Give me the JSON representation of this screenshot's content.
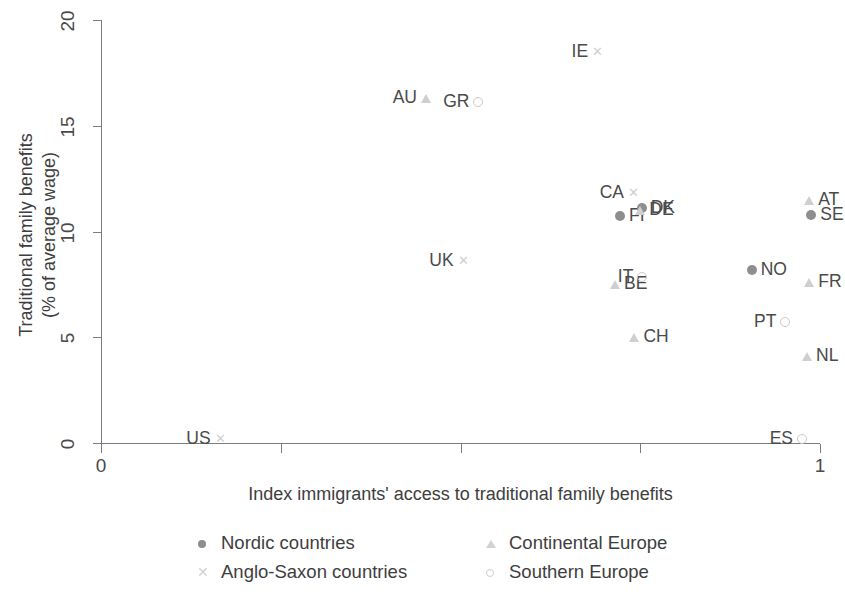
{
  "chart_data": {
    "type": "scatter",
    "title": "",
    "xlabel": "Index immigrants' access to traditional family benefits",
    "ylabel": "Traditional family benefits\n(% of average wage)",
    "ylabel_line1": "Traditional family benefits",
    "ylabel_line2": "(% of average wage)",
    "xlim": [
      0,
      1
    ],
    "ylim": [
      0,
      20
    ],
    "xticks": [
      0,
      1
    ],
    "xtick_labels": [
      "0",
      "1"
    ],
    "xminor_ticks": [
      0.25,
      0.5,
      0.75
    ],
    "yticks": [
      0,
      5,
      10,
      15,
      20
    ],
    "ytick_labels": [
      "0",
      "5",
      "10",
      "15",
      "20"
    ],
    "grid": false,
    "legend_position": "below-axes",
    "series": [
      {
        "name": "Nordic countries",
        "marker": "filled-circle",
        "color": "#8e8e8e",
        "points": [
          {
            "label": "FI",
            "x": 0.722,
            "y": 10.75,
            "label_side": "right"
          },
          {
            "label": "DK",
            "x": 0.752,
            "y": 11.1,
            "label_side": "right"
          },
          {
            "label": "NO",
            "x": 0.905,
            "y": 8.2,
            "label_side": "right"
          },
          {
            "label": "SE",
            "x": 0.988,
            "y": 10.8,
            "label_side": "right"
          }
        ]
      },
      {
        "name": "Anglo-Saxon countries",
        "marker": "cross",
        "color": "#cfcfcf",
        "points": [
          {
            "label": "IE",
            "x": 0.69,
            "y": 18.5,
            "label_side": "left"
          },
          {
            "label": "CA",
            "x": 0.74,
            "y": 11.8,
            "label_side": "left"
          },
          {
            "label": "UK",
            "x": 0.503,
            "y": 8.6,
            "label_side": "left"
          },
          {
            "label": "US",
            "x": 0.165,
            "y": 0.2,
            "label_side": "left"
          }
        ]
      },
      {
        "name": "Continental Europe",
        "marker": "triangle",
        "color": "#cfcfcf",
        "points": [
          {
            "label": "AU",
            "x": 0.452,
            "y": 16.3,
            "label_side": "left"
          },
          {
            "label": "DE",
            "x": 0.75,
            "y": 11.0,
            "label_side": "right"
          },
          {
            "label": "BE",
            "x": 0.715,
            "y": 7.5,
            "label_side": "right"
          },
          {
            "label": "CH",
            "x": 0.742,
            "y": 5.0,
            "label_side": "right"
          },
          {
            "label": "AT",
            "x": 0.985,
            "y": 11.5,
            "label_side": "right"
          },
          {
            "label": "FR",
            "x": 0.985,
            "y": 7.6,
            "label_side": "right"
          },
          {
            "label": "NL",
            "x": 0.982,
            "y": 4.1,
            "label_side": "right"
          }
        ]
      },
      {
        "name": "Southern Europe",
        "marker": "open-circle",
        "color": "#cfcfcf",
        "points": [
          {
            "label": "GR",
            "x": 0.525,
            "y": 16.1,
            "label_side": "left"
          },
          {
            "label": "IT",
            "x": 0.753,
            "y": 7.85,
            "label_side": "left"
          },
          {
            "label": "PT",
            "x": 0.952,
            "y": 5.7,
            "label_side": "left"
          },
          {
            "label": "ES",
            "x": 0.975,
            "y": 0.2,
            "label_side": "left"
          }
        ]
      }
    ]
  },
  "axes": {
    "y_title_line1": "Traditional family benefits",
    "y_title_line2": "(% of average wage)",
    "x_title": "Index immigrants' access to traditional family benefits",
    "ytick_labels": [
      "0",
      "5",
      "10",
      "15",
      "20"
    ],
    "xtick_labels": [
      "0",
      "1"
    ]
  },
  "legend": {
    "items": [
      {
        "label": "Nordic countries",
        "marker": "filled-circle"
      },
      {
        "label": "Continental Europe",
        "marker": "triangle"
      },
      {
        "label": "Anglo-Saxon countries",
        "marker": "cross"
      },
      {
        "label": "Southern Europe",
        "marker": "open-circle"
      }
    ]
  },
  "colors": {
    "axis": "#7c7c7c",
    "text": "#4a4a4a",
    "nordic": "#8e8e8e",
    "light_marker": "#cfcfcf"
  }
}
